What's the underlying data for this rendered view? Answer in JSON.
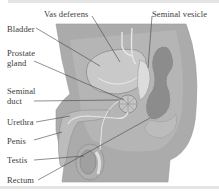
{
  "diagram": {
    "labels": {
      "vas_deferens": "Vas deferens",
      "seminal_vesicle": "Seminal vesicle",
      "bladder": "Bladder",
      "prostate_line1": "Prostate",
      "prostate_line2": "gland",
      "seminal_line1": "Seminal",
      "seminal_line2": "duct",
      "urethra": "Urethra",
      "penis": "Penis",
      "testis": "Testis",
      "rectum": "Rectum"
    },
    "colors": {
      "background": "#ffffff",
      "body_outer": "#a9a9a9",
      "body_inner": "#b8b8b8",
      "organ_light": "#c6c6c6",
      "organ_dark": "#8e8e8e",
      "rectum": "#8a8a8a",
      "leader_line": "#444444",
      "duct": "#e8e8e8",
      "frame": "#e4e4e4"
    }
  }
}
